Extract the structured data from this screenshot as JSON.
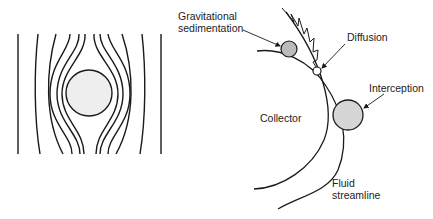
{
  "left_panel": {
    "description": "Streamlines flowing around a spherical collector",
    "collector_fill": "#eeeeee"
  },
  "right_panel": {
    "labels": {
      "gravitational_line1": "Gravitational",
      "gravitational_line2": "sedimentation",
      "diffusion": "Diffusion",
      "interception": "Interception",
      "collector": "Collector",
      "fluid_line1": "Fluid",
      "fluid_line2": "streamline"
    },
    "particle_colors": {
      "gravitational": "#bbbbbb",
      "diffusion": "#ffffff",
      "interception": "#d6d6d6"
    }
  }
}
